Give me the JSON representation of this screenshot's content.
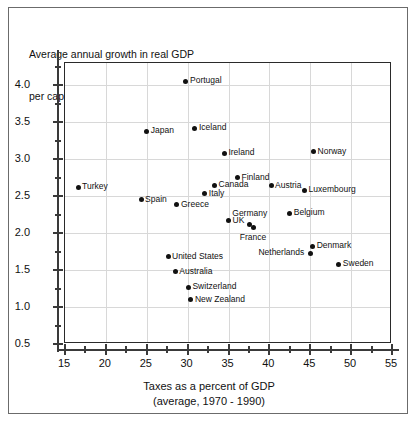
{
  "chart_data": {
    "type": "scatter",
    "title": "Average annual growth in real GDP per capita, 1970 – 1990 (percent)",
    "title_lines": [
      "Average annual growth in real GDP",
      "per capita, 1970 – 1990 (percent)"
    ],
    "xlabel": "Taxes as a percent of GDP (average, 1970 - 1990)",
    "xlabel_lines": [
      "Taxes as a percent of GDP",
      "(average, 1970 - 1990)"
    ],
    "ylabel": "",
    "xlim": [
      15,
      55
    ],
    "ylim": [
      0.5,
      4.3
    ],
    "xticks": [
      15,
      20,
      25,
      30,
      35,
      40,
      45,
      50,
      55
    ],
    "xtick_labels": [
      "15",
      "20",
      "25",
      "30",
      "35",
      "40",
      "45",
      "50",
      "55"
    ],
    "xminor_step": 2.5,
    "yticks": [
      0.5,
      1.0,
      1.5,
      2.0,
      2.5,
      3.0,
      3.5,
      4.0
    ],
    "ytick_labels": [
      "0.5",
      "1.0",
      "1.5",
      "2.0",
      "2.5",
      "3.0",
      "3.5",
      "4.0"
    ],
    "yminor_step": 0.25,
    "grid": true,
    "legend": false,
    "marker_color": "#111111",
    "grid_color": "#d8d8d8",
    "axis_color": "#2a2a2a",
    "points": [
      {
        "label": "Portugal",
        "x": 29.8,
        "y": 4.05,
        "lp": "right"
      },
      {
        "label": "Japan",
        "x": 25.0,
        "y": 3.38,
        "lp": "right"
      },
      {
        "label": "Iceland",
        "x": 30.9,
        "y": 3.42,
        "lp": "right"
      },
      {
        "label": "Ireland",
        "x": 34.5,
        "y": 3.08,
        "lp": "right"
      },
      {
        "label": "Norway",
        "x": 45.4,
        "y": 3.1,
        "lp": "right"
      },
      {
        "label": "Finland",
        "x": 36.1,
        "y": 2.75,
        "lp": "right"
      },
      {
        "label": "Canada",
        "x": 33.3,
        "y": 2.65,
        "lp": "right"
      },
      {
        "label": "Austria",
        "x": 40.2,
        "y": 2.64,
        "lp": "right"
      },
      {
        "label": "Luxembourg",
        "x": 44.3,
        "y": 2.58,
        "lp": "right"
      },
      {
        "label": "Italy",
        "x": 32.1,
        "y": 2.53,
        "lp": "right"
      },
      {
        "label": "Turkey",
        "x": 16.6,
        "y": 2.62,
        "lp": "right"
      },
      {
        "label": "Spain",
        "x": 24.3,
        "y": 2.45,
        "lp": "right"
      },
      {
        "label": "Greece",
        "x": 28.7,
        "y": 2.38,
        "lp": "right"
      },
      {
        "label": "Belgium",
        "x": 42.5,
        "y": 2.27,
        "lp": "right"
      },
      {
        "label": "UK",
        "x": 35.0,
        "y": 2.17,
        "lp": "right"
      },
      {
        "label": "Germany",
        "x": 37.6,
        "y": 2.12,
        "lp": "above"
      },
      {
        "label": "France",
        "x": 38.0,
        "y": 2.07,
        "lp": "below"
      },
      {
        "label": "Denmark",
        "x": 45.3,
        "y": 1.82,
        "lp": "right"
      },
      {
        "label": "Netherlands",
        "x": 45.0,
        "y": 1.73,
        "lp": "left"
      },
      {
        "label": "Sweden",
        "x": 48.5,
        "y": 1.58,
        "lp": "right"
      },
      {
        "label": "United States",
        "x": 27.6,
        "y": 1.68,
        "lp": "right"
      },
      {
        "label": "Australia",
        "x": 28.5,
        "y": 1.48,
        "lp": "right"
      },
      {
        "label": "Switzerland",
        "x": 30.1,
        "y": 1.27,
        "lp": "right"
      },
      {
        "label": "New Zealand",
        "x": 30.4,
        "y": 1.1,
        "lp": "right"
      }
    ]
  }
}
